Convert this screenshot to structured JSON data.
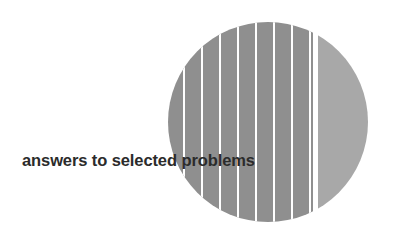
{
  "page": {
    "background_color": "#ffffff",
    "width": 398,
    "height": 240
  },
  "cover": {
    "title": "answers to selected problems",
    "title_color": "#2b2b2b"
  },
  "artwork": {
    "name": "split-striped-circle",
    "description": "Gray circle split by a vertical white gap into a wide striped left section and a narrow plain crescent on the right",
    "circle": {
      "center_x": 268,
      "center_y": 122,
      "radius": 100
    },
    "left_section": {
      "name": "striped-disc-section",
      "fill_color": "#8f8f8f",
      "right_edge_x": 313,
      "stripe_color": "#ffffff",
      "stripe_width": 2,
      "stripe_spacing": 18,
      "stripe_count": 8,
      "stripe_positions": [
        184,
        202,
        220,
        238,
        256,
        274,
        292,
        310
      ]
    },
    "gap": {
      "name": "white-split-gap",
      "color": "#ffffff",
      "start_x": 313,
      "end_x": 318
    },
    "right_section": {
      "name": "crescent-section",
      "fill_color": "#a8a8a8",
      "left_edge_x": 318
    }
  }
}
